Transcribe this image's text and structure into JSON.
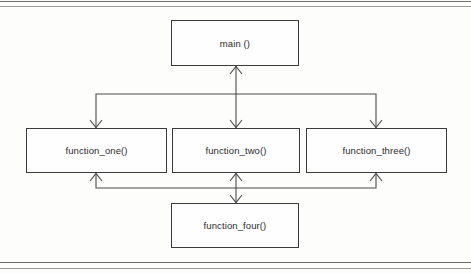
{
  "diagram": {
    "type": "structure-chart",
    "nodes": [
      {
        "id": "main",
        "label": "main ()",
        "tier": "top"
      },
      {
        "id": "function_one",
        "label": "function_one()",
        "tier": "middle"
      },
      {
        "id": "function_two",
        "label": "function_two()",
        "tier": "middle"
      },
      {
        "id": "function_three",
        "label": "function_three()",
        "tier": "middle"
      },
      {
        "id": "function_four",
        "label": "function_four()",
        "tier": "bottom"
      }
    ],
    "edges": [
      {
        "from": "main",
        "to": "function_one",
        "arrow": "down"
      },
      {
        "from": "main",
        "to": "function_two",
        "arrow": "both"
      },
      {
        "from": "main",
        "to": "function_three",
        "arrow": "down"
      },
      {
        "from": "function_four",
        "to": "function_one",
        "arrow": "up"
      },
      {
        "from": "function_four",
        "to": "function_two",
        "arrow": "both"
      },
      {
        "from": "function_four",
        "to": "function_three",
        "arrow": "up"
      }
    ],
    "colors": {
      "box_border": "#3a3a3a",
      "box_fill": "#fefefe",
      "connector": "#4a4a4a",
      "page_background": "#fdfdfc",
      "rule": "#6f6f6f"
    }
  }
}
